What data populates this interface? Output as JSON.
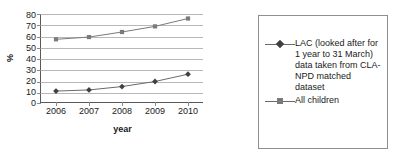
{
  "chart_data": {
    "type": "line",
    "title": "",
    "xlabel": "year",
    "ylabel": "%",
    "categories": [
      "2006",
      "2007",
      "2008",
      "2009",
      "2010"
    ],
    "x": [
      2006,
      2007,
      2008,
      2009,
      2010
    ],
    "ylim": [
      0,
      80
    ],
    "yticks": [
      "80",
      "70",
      "60",
      "50",
      "40",
      "30",
      "20",
      "10",
      "0"
    ],
    "ytick_values": [
      80,
      70,
      60,
      50,
      40,
      30,
      20,
      10,
      0
    ],
    "grid": true,
    "legend_position": "right",
    "series": [
      {
        "name": "LAC (looked after for 1 year to 31 March) data taken from CLA-NPD matched dataset",
        "marker": "diamond",
        "color": "#404040",
        "values": [
          11.5,
          12.5,
          15.5,
          20.0,
          26.5
        ]
      },
      {
        "name": "All children",
        "marker": "square",
        "color": "#7a7a7a",
        "values": [
          57.5,
          59.5,
          64.0,
          69.0,
          76.0
        ]
      }
    ]
  },
  "legend": {
    "entries": [
      {
        "label": "LAC (looked after for 1 year to 31 March) data taken from CLA-NPD matched dataset",
        "marker": "diamond-marker"
      },
      {
        "label": "All children",
        "marker": "square-marker"
      }
    ]
  },
  "axes": {
    "y_axis_title": "%",
    "x_axis_title": "year"
  },
  "title_fragment": ""
}
